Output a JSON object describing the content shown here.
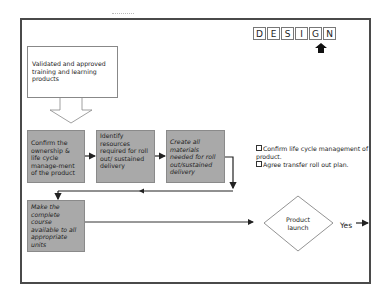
{
  "slide": {
    "title_letters": [
      "D",
      "E",
      "S",
      "I",
      "G",
      "N"
    ],
    "active_letter_index": 4,
    "input_callout": "Validated and approved training and learning products",
    "process_steps": [
      {
        "id": "step-1",
        "label": "Confirm the ownership & life cycle manage-ment of the product"
      },
      {
        "id": "step-2",
        "label": "Identify resources required for roll out/ sustained delivery"
      },
      {
        "id": "step-3",
        "label": "Create all materials needed for roll out/sustained delivery"
      },
      {
        "id": "step-4",
        "label": "Make the complete course available to all appropriate units"
      }
    ],
    "decision": {
      "label_line1": "Product",
      "label_line2": "launch",
      "yes_label": "Yes"
    },
    "checklist": [
      "Confirm life cycle management of product.",
      "Agree transfer roll out plan."
    ],
    "colors": {
      "process_fill": "#a9a9a9",
      "frame": "#4a4a4a",
      "lines": "#222222"
    }
  }
}
